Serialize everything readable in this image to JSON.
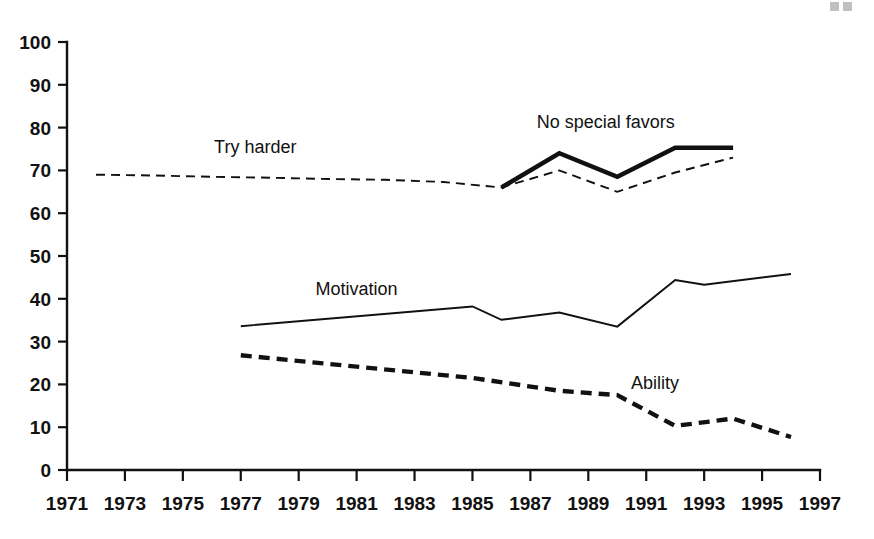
{
  "chart_data": {
    "type": "line",
    "title": "",
    "xlabel": "",
    "ylabel": "",
    "xlim": [
      1971,
      1997
    ],
    "ylim": [
      0,
      100
    ],
    "grid": false,
    "legend_position": "inline-annotations",
    "x_tick_labels": [
      "1971",
      "1973",
      "1975",
      "1977",
      "1979",
      "1981",
      "1983",
      "1985",
      "1987",
      "1989",
      "1991",
      "1993",
      "1995",
      "1997"
    ],
    "x_tick_values": [
      1971,
      1973,
      1975,
      1977,
      1979,
      1981,
      1983,
      1985,
      1987,
      1989,
      1991,
      1993,
      1995,
      1997
    ],
    "y_tick_labels": [
      "0",
      "10",
      "20",
      "30",
      "40",
      "50",
      "60",
      "70",
      "80",
      "90",
      "100"
    ],
    "y_tick_values": [
      0,
      10,
      20,
      30,
      40,
      50,
      60,
      70,
      80,
      90,
      100
    ],
    "series": [
      {
        "name": "Try harder",
        "style": "thin-dashed",
        "color": "#111111",
        "label": "Try harder",
        "label_x": 1977.5,
        "label_y": 74,
        "x": [
          1972,
          1974,
          1976,
          1978,
          1980,
          1982,
          1984,
          1986,
          1988,
          1990,
          1992,
          1994
        ],
        "values": [
          69.0,
          68.8,
          68.5,
          68.3,
          68.0,
          67.8,
          67.3,
          66.0,
          70.0,
          65.0,
          69.5,
          73.0
        ]
      },
      {
        "name": "No special favors",
        "style": "thick-solid",
        "color": "#111111",
        "label": "No special favors",
        "label_x": 1989.6,
        "label_y": 80,
        "x": [
          1986,
          1988,
          1990,
          1992,
          1994
        ],
        "values": [
          66.0,
          74.0,
          68.5,
          75.3,
          75.3
        ]
      },
      {
        "name": "Motivation",
        "style": "thin-solid",
        "color": "#111111",
        "label": "Motivation",
        "label_x": 1981.0,
        "label_y": 41,
        "x": [
          1977,
          1985,
          1986,
          1988,
          1990,
          1992,
          1993,
          1996
        ],
        "values": [
          33.6,
          38.2,
          35.1,
          36.8,
          33.5,
          44.4,
          43.3,
          45.8
        ]
      },
      {
        "name": "Ability",
        "style": "thick-dashed",
        "color": "#111111",
        "label": "Ability",
        "label_x": 1991.3,
        "label_y": 19,
        "x": [
          1977,
          1985,
          1988,
          1990,
          1992,
          1994,
          1996
        ],
        "values": [
          26.8,
          21.5,
          18.5,
          17.5,
          10.3,
          12.0,
          7.7
        ]
      }
    ]
  },
  "figure": {
    "background_color": "#ffffff",
    "ink_color": "#111111"
  }
}
